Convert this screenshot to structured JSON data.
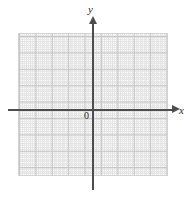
{
  "figure": {
    "background_color": "#ffffff"
  },
  "axes": {
    "x_label": "x",
    "y_label": "y",
    "origin_label": "0",
    "axis_color": "#4d4d4d",
    "arrow_x_name": "x-axis-arrowhead",
    "arrow_y_name": "y-axis-arrowhead"
  },
  "grid": {
    "major_color": "#bfbfbf",
    "minor_color": "#d9d9d9",
    "border_color": "#cfcfcf",
    "major_cells_x": 9,
    "major_cells_y": 9,
    "minor_per_major": 4
  },
  "chart_data": {
    "type": "scatter",
    "title": "",
    "xlabel": "x",
    "ylabel": "y",
    "origin_label": "0",
    "grid": true,
    "legend": "none",
    "xlim": [
      -5,
      5
    ],
    "ylim": [
      -4,
      5
    ],
    "xticks": [
      -5,
      -4,
      -3,
      -2,
      -1,
      0,
      1,
      2,
      3,
      4,
      5
    ],
    "yticks": [
      -4,
      -3,
      -2,
      -1,
      0,
      1,
      2,
      3,
      4,
      5
    ],
    "xtick_labels": [
      "",
      "",
      "",
      "",
      "",
      "0",
      "",
      "",
      "",
      "",
      ""
    ],
    "ytick_labels": [
      "",
      "",
      "",
      "",
      "",
      "",
      "",
      "",
      "",
      ""
    ],
    "series": [
      {
        "name": "empty-plot",
        "x": [],
        "y": []
      }
    ],
    "annotations": []
  }
}
